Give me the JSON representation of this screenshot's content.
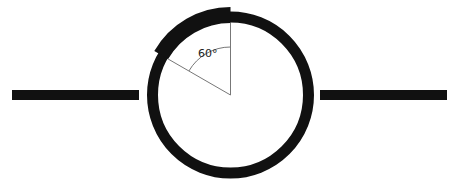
{
  "diagram": {
    "type": "wire-ring-with-arc-segment",
    "colors": {
      "ink": "#111111",
      "thin_line": "#777777",
      "background": "#ffffff"
    },
    "left_wire": {
      "x1": 12,
      "x2": 139,
      "y": 95,
      "thickness": 10
    },
    "right_wire": {
      "x1": 320,
      "x2": 447,
      "y": 95,
      "thickness": 10
    },
    "ring": {
      "cx": 230.5,
      "cy": 95,
      "r": 78,
      "thickness": 11
    },
    "thick_arc": {
      "start_deg_from_top": 0,
      "end_deg_from_top_ccw": 60,
      "outer_r": 88,
      "inner_r": 72
    },
    "angle": {
      "value_deg": 60,
      "label": "60°",
      "arc_r": 48
    }
  }
}
